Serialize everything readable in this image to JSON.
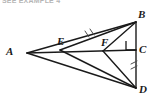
{
  "header": {
    "text": "SEE EXAMPLE 4"
  },
  "figure": {
    "name": "geometry-triangle-diagram",
    "stroke_color": "#1a1a1a",
    "background_color": "#ffffff",
    "vertices": [
      {
        "id": "A",
        "label": "A",
        "x": 27,
        "y": 53,
        "label_x": 6,
        "label_y": 46
      },
      {
        "id": "B",
        "label": "B",
        "x": 136,
        "y": 22,
        "label_x": 138,
        "label_y": 9
      },
      {
        "id": "C",
        "label": "C",
        "x": 136,
        "y": 50,
        "label_x": 139,
        "label_y": 44
      },
      {
        "id": "D",
        "label": "D",
        "x": 136,
        "y": 88,
        "label_x": 139,
        "label_y": 84
      },
      {
        "id": "E",
        "label": "E",
        "x": 60,
        "y": 50,
        "label_x": 57,
        "label_y": 36
      },
      {
        "id": "F",
        "label": "F",
        "x": 103,
        "y": 51,
        "label_x": 101,
        "label_y": 37
      }
    ],
    "segments": [
      {
        "name": "segment-A-B",
        "from": "A",
        "to": "B"
      },
      {
        "name": "segment-A-C",
        "from": "A",
        "to": "C"
      },
      {
        "name": "segment-A-D",
        "from": "A",
        "to": "D"
      },
      {
        "name": "segment-E-B",
        "from": "E",
        "to": "B"
      },
      {
        "name": "segment-E-D",
        "from": "E",
        "to": "D"
      },
      {
        "name": "segment-F-B",
        "from": "F",
        "to": "B"
      },
      {
        "name": "segment-F-D",
        "from": "F",
        "to": "D"
      },
      {
        "name": "segment-B-C",
        "from": "B",
        "to": "C"
      },
      {
        "name": "segment-C-D",
        "from": "C",
        "to": "D"
      }
    ],
    "markers": {
      "right_angle": {
        "name": "right-angle-marker-at-C",
        "vertex": "C",
        "size": 9
      },
      "tick_marks": [
        {
          "name": "tick-marks-segment-EB",
          "segment": "segment-E-B",
          "count": 2
        },
        {
          "name": "tick-marks-segment-CD",
          "segment": "segment-C-D",
          "count": 2
        }
      ]
    }
  }
}
